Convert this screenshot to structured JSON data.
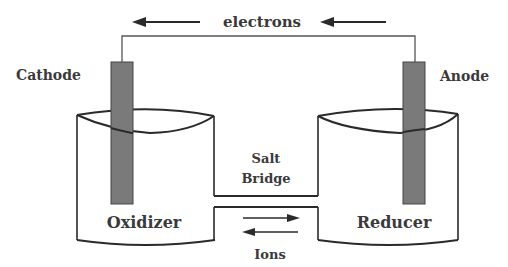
{
  "diagram": {
    "labels": {
      "electrons": "electrons",
      "cathode": "Cathode",
      "anode": "Anode",
      "salt_bridge_line1": "Salt",
      "salt_bridge_line2": "Bridge",
      "oxidizer": "Oxidizer",
      "reducer": "Reducer",
      "ions": "Ions"
    },
    "colors": {
      "line": "#2a2a2a",
      "electrode": "#7a7a7a",
      "text": "#3a3a3a",
      "background": "#ffffff"
    },
    "arrows": {
      "electron_flow": "right-to-left",
      "ion_flow": "bidirectional"
    }
  }
}
